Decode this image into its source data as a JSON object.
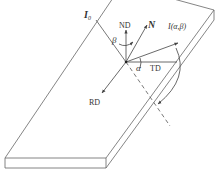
{
  "diagram": {
    "type": "coordinate-system-on-plate",
    "labels": {
      "incident": "I",
      "incident_sub": "0",
      "normal_direction": "ND",
      "normal_vector": "N",
      "beta": "β",
      "reflected": "I(α,β)",
      "alpha": "α",
      "transverse_direction": "TD",
      "rolling_direction": "RD"
    },
    "colors": {
      "line": "#555555",
      "text": "#333333",
      "background": "#ffffff"
    }
  }
}
